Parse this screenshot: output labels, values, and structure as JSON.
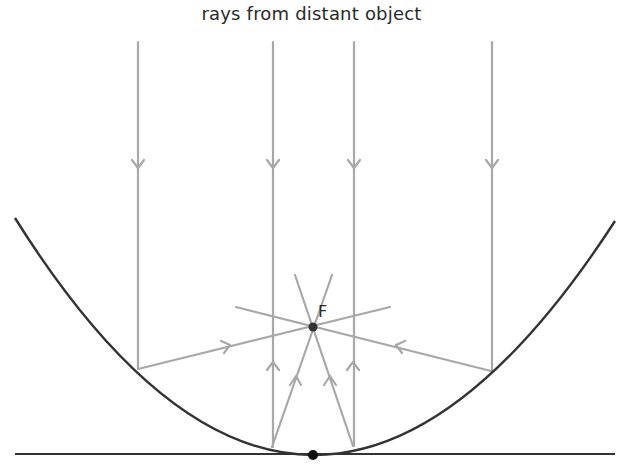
{
  "title": "rays from distant object",
  "focus_label": "F",
  "colors": {
    "ray": "#a8a8a8",
    "mirror": "#333333",
    "axis_line": "#333333",
    "point": "#222222",
    "background": "#ffffff"
  },
  "diagram": {
    "type": "parabolic-mirror-ray-diagram",
    "mirror": {
      "left_end": [
        15,
        218
      ],
      "vertex": [
        313,
        455
      ],
      "right_end": [
        615,
        221
      ]
    },
    "tangent_line": {
      "from": [
        15,
        454
      ],
      "to": [
        615,
        454
      ]
    },
    "focus_point": [
      313,
      327
    ],
    "vertex_point": [
      313,
      455
    ],
    "incident_rays_x": [
      138,
      273,
      354,
      492
    ],
    "incident_ray_top_y": 42,
    "incident_direction": "downward",
    "reflected_rays_direction": "toward focus F"
  }
}
